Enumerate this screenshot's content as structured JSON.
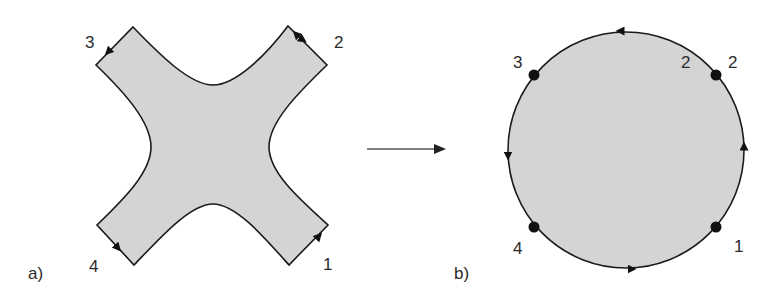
{
  "figure": {
    "panel_a": {
      "label": "a)",
      "shape": "cross-shaped region with four truncated arms",
      "corner_labels": {
        "top_left": "3",
        "top_right": "2",
        "bottom_left": "4",
        "bottom_right": "1"
      }
    },
    "transition_arrow": {
      "direction": "right"
    },
    "panel_b": {
      "label": "b)",
      "shape": "disk with oriented boundary",
      "point_labels": {
        "top_left": "3",
        "top_right_inner": "2",
        "top_right_outer": "2",
        "bottom_left": "4",
        "bottom_right": "1"
      }
    },
    "colors": {
      "fill": "#d4d4d4",
      "stroke": "#1a1a1a",
      "text": "#2a2a2a"
    }
  }
}
